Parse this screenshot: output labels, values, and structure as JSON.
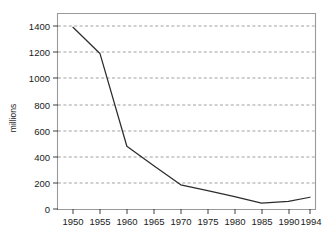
{
  "chart_data": {
    "type": "line",
    "title": "",
    "subtitle": "",
    "xlabel": "",
    "ylabel": "millions",
    "x": [
      1950,
      1955,
      1960,
      1965,
      1970,
      1975,
      1980,
      1985,
      1990,
      1994
    ],
    "xtick_labels": [
      "1950",
      "1955",
      "1960",
      "1965",
      "1970",
      "1975",
      "1980",
      "1985",
      "1990",
      "1994"
    ],
    "ytick_labels": [
      "0",
      "200",
      "400",
      "600",
      "800",
      "1000",
      "1200",
      "1400"
    ],
    "yticks": [
      0,
      200,
      400,
      600,
      800,
      1000,
      1200,
      1400
    ],
    "ylim": [
      0,
      1460
    ],
    "xlim": [
      1947.5,
      1996.5
    ],
    "grid": "horizontal-dashed",
    "legend": "none",
    "series": [
      {
        "name": "millions",
        "color": "#2c2c2c",
        "values": [
          1390,
          1190,
          480,
          330,
          185,
          140,
          95,
          45,
          58,
          90
        ]
      }
    ]
  },
  "axes": {
    "y_axis_title": "millions"
  }
}
